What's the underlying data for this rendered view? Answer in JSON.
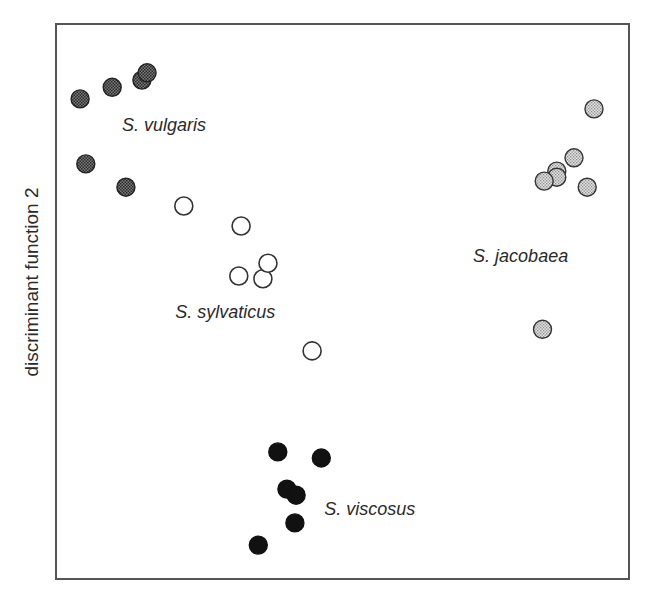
{
  "chart_data": {
    "type": "scatter",
    "title": "",
    "xlabel": "",
    "ylabel": "discriminant function 2",
    "xlim": [
      0,
      100
    ],
    "ylim": [
      0,
      100
    ],
    "grid": false,
    "ticks": false,
    "legend": "none (groups labeled inline)",
    "coordinate_note": "no axis ticks shown; values are positions normalized to the plot frame (0 = left/bottom, 100 = right/top)",
    "series": [
      {
        "name": "S. vulgaris",
        "marker": "dark-stippled",
        "fill": "#4a4a4a",
        "stroke": "#222222",
        "label_pos": {
          "x": 11.5,
          "y": 80.8
        },
        "points": [
          {
            "x": 4.2,
            "y": 86.5
          },
          {
            "x": 9.8,
            "y": 88.6
          },
          {
            "x": 15.0,
            "y": 89.9
          },
          {
            "x": 15.9,
            "y": 91.2
          },
          {
            "x": 5.2,
            "y": 74.8
          },
          {
            "x": 12.2,
            "y": 70.6
          }
        ]
      },
      {
        "name": "S. sylvaticus",
        "marker": "open-circle",
        "fill": "#ffffff",
        "stroke": "#333333",
        "label_pos": {
          "x": 20.8,
          "y": 47.1
        },
        "points": [
          {
            "x": 22.3,
            "y": 67.2
          },
          {
            "x": 32.3,
            "y": 63.6
          },
          {
            "x": 31.9,
            "y": 54.6
          },
          {
            "x": 36.1,
            "y": 54.1
          },
          {
            "x": 37.0,
            "y": 56.9
          },
          {
            "x": 44.7,
            "y": 41.1
          }
        ]
      },
      {
        "name": "S. jacobaea",
        "marker": "light-stippled",
        "fill": "#b8b8b8",
        "stroke": "#333333",
        "label_pos": {
          "x": 72.8,
          "y": 57.1
        },
        "points": [
          {
            "x": 93.9,
            "y": 84.7
          },
          {
            "x": 90.4,
            "y": 75.9
          },
          {
            "x": 87.4,
            "y": 73.5
          },
          {
            "x": 87.4,
            "y": 72.4
          },
          {
            "x": 85.2,
            "y": 71.7
          },
          {
            "x": 92.7,
            "y": 70.6
          },
          {
            "x": 84.9,
            "y": 45.0
          }
        ]
      },
      {
        "name": "S. viscosus",
        "marker": "solid-black",
        "fill": "#111111",
        "stroke": "#111111",
        "label_pos": {
          "x": 46.8,
          "y": 11.5
        },
        "points": [
          {
            "x": 38.7,
            "y": 22.9
          },
          {
            "x": 46.3,
            "y": 21.8
          },
          {
            "x": 40.3,
            "y": 16.2
          },
          {
            "x": 41.9,
            "y": 15.1
          },
          {
            "x": 41.7,
            "y": 10.1
          },
          {
            "x": 35.3,
            "y": 6.1
          }
        ]
      }
    ]
  },
  "plot": {
    "frame": {
      "left": 56,
      "top": 24,
      "right": 629,
      "bottom": 579
    },
    "marker_radius": 9,
    "frame_color": "#555555"
  }
}
